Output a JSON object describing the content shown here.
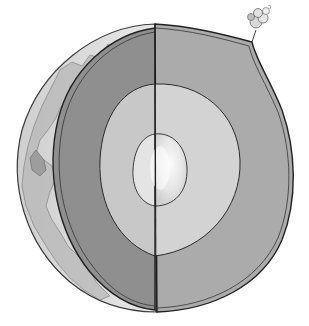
{
  "figure": {
    "layers": [
      {
        "name": "Crust",
        "color": "#e2e2e2"
      },
      {
        "name": "Mantle (left cut face)",
        "color": "#8e8e8e"
      },
      {
        "name": "Mantle",
        "color": "#aaaaaa"
      },
      {
        "name": "Outer core",
        "color": "#cfcfcf"
      },
      {
        "name": "Inner core",
        "color": "#ececec"
      }
    ],
    "features": [
      "volcano-plume",
      "continents"
    ],
    "outline_color": "#2a2a2a"
  }
}
